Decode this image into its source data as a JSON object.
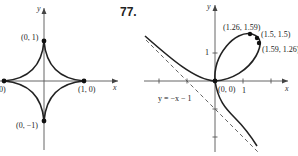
{
  "problem_number": "77.",
  "left_figure": {
    "name": "astroid",
    "axis_x_label": "x",
    "axis_y_label": "y",
    "points": [
      {
        "label": "(0, 1)"
      },
      {
        "label": "(1, 0)"
      },
      {
        "label": "(0, −1)"
      },
      {
        "label": "(−1, 0)",
        "visible_label": "0)"
      }
    ]
  },
  "right_figure": {
    "name": "folium-of-descartes",
    "axis_x_label": "x",
    "axis_y_label": "y",
    "tick_x_label": "1",
    "tick_y_label": "1",
    "asymptote_label": "y = −x − 1",
    "points": [
      {
        "label": "(1.26, 1.59)"
      },
      {
        "label": "(1.5, 1.5)"
      },
      {
        "label": "(1.59, 1.26)"
      },
      {
        "label": "(0, 0)"
      }
    ]
  },
  "colors": {
    "ink": "#222222",
    "axis": "#555555",
    "background": "#ffffff"
  }
}
